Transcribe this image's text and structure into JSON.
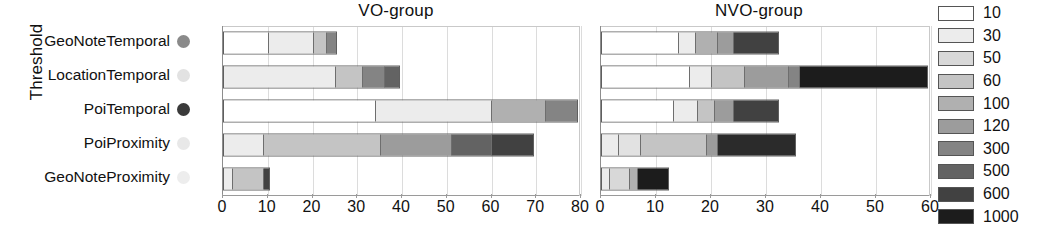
{
  "axis": {
    "y_title": "Threshold",
    "categories": [
      {
        "label": "GeoNoteTemporal",
        "marker_color": "#8a8a8a"
      },
      {
        "label": "LocationTemporal",
        "marker_color": "#e2e2e2"
      },
      {
        "label": "PoiTemporal",
        "marker_color": "#3a3a3a"
      },
      {
        "label": "PoiProximity",
        "marker_color": "#e8e8e8"
      },
      {
        "label": "GeoNoteProximity",
        "marker_color": "#ededed"
      }
    ]
  },
  "legend": {
    "title": "",
    "entries": [
      {
        "label": "10",
        "color": "#ffffff"
      },
      {
        "label": "30",
        "color": "#ececec"
      },
      {
        "label": "50",
        "color": "#d8d8d8"
      },
      {
        "label": "60",
        "color": "#c4c4c4"
      },
      {
        "label": "100",
        "color": "#b0b0b0"
      },
      {
        "label": "120",
        "color": "#9c9c9c"
      },
      {
        "label": "300",
        "color": "#848484"
      },
      {
        "label": "500",
        "color": "#636363"
      },
      {
        "label": "600",
        "color": "#414141"
      },
      {
        "label": "1000",
        "color": "#1c1c1c"
      }
    ]
  },
  "chart_data": {
    "type": "bar",
    "title": "",
    "orientation": "horizontal",
    "stacked": true,
    "ylabel": "Threshold",
    "xlabel": "",
    "grid": true,
    "legend_position": "right",
    "legend_title": "",
    "categories": [
      "GeoNoteTemporal",
      "LocationTemporal",
      "PoiTemporal",
      "PoiProximity",
      "GeoNoteProximity"
    ],
    "series_names": [
      "10",
      "30",
      "50",
      "60",
      "100",
      "120",
      "300",
      "500",
      "600",
      "1000"
    ],
    "panels": [
      {
        "title": "VO-group",
        "xlim": [
          0,
          80
        ],
        "xticks": [
          0,
          10,
          20,
          30,
          40,
          50,
          60,
          70,
          80
        ],
        "series": [
          {
            "name": "10",
            "values": [
              10,
              0,
              34,
              0,
              0
            ]
          },
          {
            "name": "30",
            "values": [
              10,
              25,
              26,
              9,
              2
            ]
          },
          {
            "name": "50",
            "values": [
              0,
              0,
              0,
              0,
              0
            ]
          },
          {
            "name": "60",
            "values": [
              3,
              6,
              0,
              26,
              7
            ]
          },
          {
            "name": "100",
            "values": [
              0,
              0,
              12,
              0,
              0
            ]
          },
          {
            "name": "120",
            "values": [
              0,
              0,
              0,
              16,
              0
            ]
          },
          {
            "name": "300",
            "values": [
              2,
              5,
              7,
              0,
              0
            ]
          },
          {
            "name": "500",
            "values": [
              0,
              3,
              0,
              9,
              1
            ]
          },
          {
            "name": "600",
            "values": [
              0,
              0,
              0,
              9,
              0
            ]
          },
          {
            "name": "1000",
            "values": [
              0,
              0,
              0,
              0,
              0
            ]
          }
        ],
        "totals": [
          25,
          39,
          79,
          69,
          10
        ]
      },
      {
        "title": "NVO-group",
        "xlim": [
          0,
          60
        ],
        "xticks": [
          0,
          10,
          20,
          30,
          40,
          50,
          60
        ],
        "series": [
          {
            "name": "10",
            "values": [
              14,
              16,
              13,
              0,
              0
            ]
          },
          {
            "name": "30",
            "values": [
              3,
              4,
              4.5,
              3,
              1.5
            ]
          },
          {
            "name": "50",
            "values": [
              0,
              0,
              0,
              4,
              3.5
            ]
          },
          {
            "name": "60",
            "values": [
              4,
              6,
              3,
              12,
              0
            ]
          },
          {
            "name": "100",
            "values": [
              3,
              8,
              3.5,
              0,
              1.5
            ]
          },
          {
            "name": "120",
            "values": [
              0,
              2,
              0,
              2,
              0
            ]
          },
          {
            "name": "300",
            "values": [
              0,
              0,
              0,
              0,
              0
            ]
          },
          {
            "name": "500",
            "values": [
              0,
              0,
              0,
              0,
              0
            ]
          },
          {
            "name": "600",
            "values": [
              8,
              0,
              8,
              14,
              0
            ]
          },
          {
            "name": "1000",
            "values": [
              0,
              23,
              0,
              0,
              5.5
            ]
          }
        ],
        "totals": [
          32,
          59,
          32,
          35,
          12
        ]
      }
    ]
  },
  "render": {
    "left_panel": {
      "x": 200,
      "width": 392,
      "plot_left": 22,
      "plot_right": 380,
      "max": 80,
      "bars": [
        {
          "segments": [
            {
              "w": 10,
              "c": "#ffffff"
            },
            {
              "w": 10,
              "c": "#ececec"
            },
            {
              "w": 3,
              "c": "#c4c4c4"
            },
            {
              "w": 2,
              "c": "#848484"
            }
          ]
        },
        {
          "segments": [
            {
              "w": 25,
              "c": "#ececec"
            },
            {
              "w": 6,
              "c": "#c4c4c4"
            },
            {
              "w": 5,
              "c": "#848484"
            },
            {
              "w": 3,
              "c": "#636363"
            }
          ]
        },
        {
          "segments": [
            {
              "w": 34,
              "c": "#ffffff"
            },
            {
              "w": 26,
              "c": "#ececec"
            },
            {
              "w": 12,
              "c": "#b0b0b0"
            },
            {
              "w": 7,
              "c": "#848484"
            }
          ]
        },
        {
          "segments": [
            {
              "w": 9,
              "c": "#ececec"
            },
            {
              "w": 26,
              "c": "#c4c4c4"
            },
            {
              "w": 16,
              "c": "#9c9c9c"
            },
            {
              "w": 9,
              "c": "#636363"
            },
            {
              "w": 9,
              "c": "#414141"
            }
          ]
        },
        {
          "segments": [
            {
              "w": 2,
              "c": "#ececec"
            },
            {
              "w": 7,
              "c": "#c4c4c4"
            },
            {
              "w": 1,
              "c": "#414141"
            }
          ]
        }
      ]
    },
    "right_panel": {
      "x": 578,
      "width": 362,
      "plot_left": 22,
      "plot_right": 352,
      "max": 60,
      "bars": [
        {
          "segments": [
            {
              "w": 14,
              "c": "#ffffff"
            },
            {
              "w": 3,
              "c": "#ececec"
            },
            {
              "w": 4,
              "c": "#b0b0b0"
            },
            {
              "w": 3,
              "c": "#9c9c9c"
            },
            {
              "w": 8,
              "c": "#414141"
            }
          ]
        },
        {
          "segments": [
            {
              "w": 16,
              "c": "#ffffff"
            },
            {
              "w": 4,
              "c": "#ececec"
            },
            {
              "w": 6,
              "c": "#c4c4c4"
            },
            {
              "w": 8,
              "c": "#9c9c9c"
            },
            {
              "w": 2,
              "c": "#848484"
            },
            {
              "w": 23,
              "c": "#1c1c1c"
            }
          ]
        },
        {
          "segments": [
            {
              "w": 13,
              "c": "#ffffff"
            },
            {
              "w": 4.5,
              "c": "#ececec"
            },
            {
              "w": 3,
              "c": "#c4c4c4"
            },
            {
              "w": 3.5,
              "c": "#9c9c9c"
            },
            {
              "w": 8,
              "c": "#414141"
            }
          ]
        },
        {
          "segments": [
            {
              "w": 3,
              "c": "#ececec"
            },
            {
              "w": 4,
              "c": "#e2e2e2"
            },
            {
              "w": 12,
              "c": "#c4c4c4"
            },
            {
              "w": 2,
              "c": "#9c9c9c"
            },
            {
              "w": 14,
              "c": "#2b2b2b"
            }
          ]
        },
        {
          "segments": [
            {
              "w": 1.5,
              "c": "#ececec"
            },
            {
              "w": 3.5,
              "c": "#d8d8d8"
            },
            {
              "w": 1.5,
              "c": "#b0b0b0"
            },
            {
              "w": 5.5,
              "c": "#1c1c1c"
            }
          ]
        }
      ]
    }
  }
}
